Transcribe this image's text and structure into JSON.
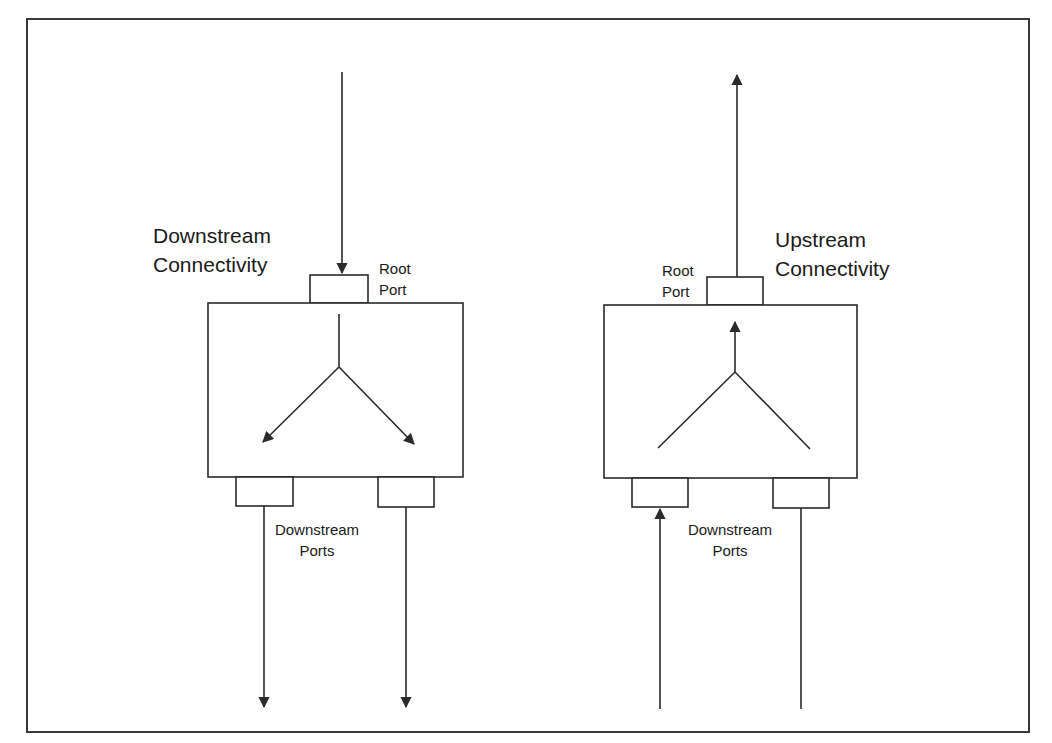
{
  "caption_fragment": "",
  "panels": [
    {
      "id": "downstream",
      "title_line1": "Downstream",
      "title_line2": "Connectivity",
      "root_port_line1": "Root",
      "root_port_line2": "Port",
      "ports_label_line1": "Downstream",
      "ports_label_line2": "Ports",
      "flow_direction": "downstream"
    },
    {
      "id": "upstream",
      "title_line1": "Upstream",
      "title_line2": "Connectivity",
      "root_port_line1": "Root",
      "root_port_line2": "Port",
      "ports_label_line1": "Downstream",
      "ports_label_line2": "Ports",
      "flow_direction": "upstream"
    }
  ],
  "colors": {
    "line": "#2a2a2a",
    "background": "#ffffff"
  }
}
